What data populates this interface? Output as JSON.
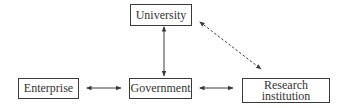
{
  "diagram": {
    "title": "",
    "nodes": {
      "university": {
        "label": "University"
      },
      "enterprise": {
        "label": "Enterprise"
      },
      "government": {
        "label": "Government"
      },
      "research": {
        "line1": "Research",
        "line2": "institution"
      }
    },
    "edges": [
      {
        "from": "University",
        "to": "Government",
        "style": "solid",
        "direction": "bidirectional"
      },
      {
        "from": "Enterprise",
        "to": "Government",
        "style": "solid",
        "direction": "bidirectional"
      },
      {
        "from": "Government",
        "to": "Research institution",
        "style": "solid",
        "direction": "bidirectional"
      },
      {
        "from": "University",
        "to": "Research institution",
        "style": "dashed",
        "direction": "bidirectional"
      }
    ],
    "colors": {
      "stroke": "#3a3a3a",
      "text": "#333333",
      "background": "#ffffff"
    }
  }
}
